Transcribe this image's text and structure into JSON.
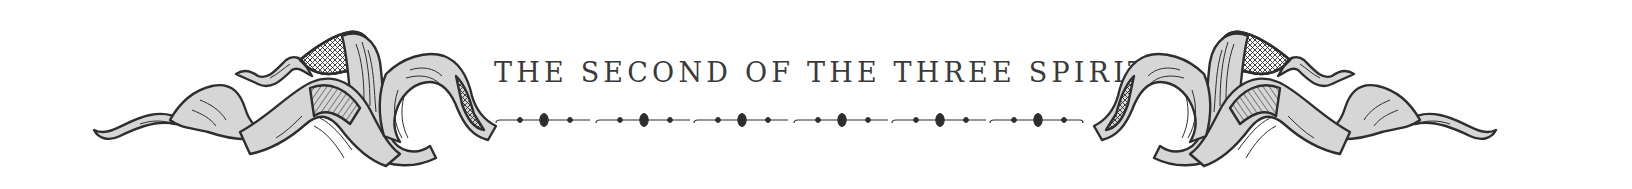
{
  "heading": {
    "title": "THE SECOND OF THE THREE SPIRITS"
  },
  "ornament": {
    "left": "ribbon-flourish-icon",
    "right": "ribbon-flourish-icon",
    "divider_segments": 6
  },
  "colors": {
    "ink": "#2e2e2e",
    "ribbon_fill": "#d6d6d6",
    "background": "#ffffff",
    "text": "#3a3a3a"
  }
}
